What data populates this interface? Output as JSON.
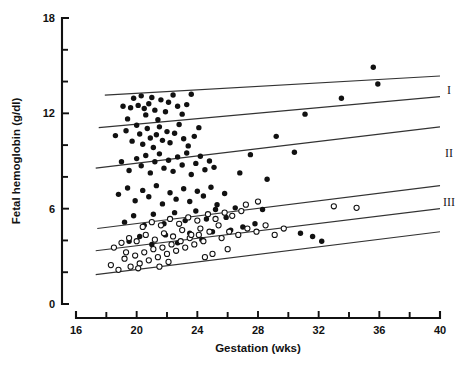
{
  "chart_data": {
    "type": "scatter",
    "title": "",
    "xlabel": "Gestation (wks)",
    "ylabel": "Fetal hemoglobin (g/dl)",
    "xlim": [
      16,
      40
    ],
    "ylim": [
      0,
      18
    ],
    "grid": false,
    "legend_position": "right-inline",
    "x_ticks_major": [
      16,
      20,
      24,
      28,
      32,
      36,
      40
    ],
    "x_tick_labels": [
      "16",
      "20",
      "24",
      "28",
      "32",
      "36",
      "40"
    ],
    "x_ticks_minor": [
      18,
      22,
      26,
      30,
      34,
      38
    ],
    "y_ticks_major": [
      0,
      6,
      12,
      18
    ],
    "y_tick_labels": [
      "0",
      "6",
      "12",
      "18"
    ],
    "y_ticks_minor": [
      2,
      4,
      8,
      10,
      14,
      16
    ],
    "annotations": [
      {
        "text": "I",
        "x": 40.6,
        "y": 13.45
      },
      {
        "text": "II",
        "x": 40.6,
        "y": 9.5
      },
      {
        "text": "III",
        "x": 40.6,
        "y": 6.45
      }
    ],
    "reference_lines": [
      {
        "name": "line-1-upper",
        "x0": 17.9,
        "y0": 13.15,
        "x1": 40.0,
        "y1": 14.35
      },
      {
        "name": "line-2",
        "x0": 17.5,
        "y0": 11.1,
        "x1": 40.0,
        "y1": 13.05
      },
      {
        "name": "line-3",
        "x0": 17.3,
        "y0": 8.55,
        "x1": 40.0,
        "y1": 11.15
      },
      {
        "name": "line-4",
        "x0": 17.4,
        "y0": 4.75,
        "x1": 40.0,
        "y1": 7.45
      },
      {
        "name": "line-5",
        "x0": 17.3,
        "y0": 3.35,
        "x1": 40.0,
        "y1": 6.0
      },
      {
        "name": "line-6-lower",
        "x0": 17.3,
        "y0": 1.85,
        "x1": 40.0,
        "y1": 4.55
      }
    ],
    "series": [
      {
        "name": "filled-circles",
        "marker": "filled-circle",
        "color": "#111111",
        "points": [
          [
            19.1,
            12.45
          ],
          [
            19.4,
            11.65
          ],
          [
            19.6,
            12.35
          ],
          [
            19.8,
            12.95
          ],
          [
            20.1,
            12.5
          ],
          [
            20.3,
            13.1
          ],
          [
            20.5,
            12.3
          ],
          [
            20.6,
            11.9
          ],
          [
            20.8,
            12.6
          ],
          [
            21.0,
            13.0
          ],
          [
            21.2,
            12.2
          ],
          [
            21.4,
            11.6
          ],
          [
            21.6,
            12.85
          ],
          [
            21.9,
            12.1
          ],
          [
            22.1,
            12.7
          ],
          [
            22.4,
            13.15
          ],
          [
            22.7,
            12.45
          ],
          [
            23.0,
            11.95
          ],
          [
            23.3,
            12.55
          ],
          [
            23.6,
            13.2
          ],
          [
            18.6,
            10.6
          ],
          [
            19.3,
            10.9
          ],
          [
            19.7,
            10.25
          ],
          [
            20.0,
            11.25
          ],
          [
            20.2,
            10.7
          ],
          [
            20.4,
            10.05
          ],
          [
            20.7,
            11.05
          ],
          [
            20.9,
            10.45
          ],
          [
            21.1,
            9.85
          ],
          [
            21.3,
            10.65
          ],
          [
            21.5,
            11.15
          ],
          [
            21.7,
            10.3
          ],
          [
            22.0,
            10.85
          ],
          [
            22.2,
            10.15
          ],
          [
            22.5,
            10.75
          ],
          [
            22.8,
            11.3
          ],
          [
            23.1,
            10.4
          ],
          [
            23.4,
            9.95
          ],
          [
            23.8,
            10.55
          ],
          [
            24.1,
            11.1
          ],
          [
            19.0,
            8.95
          ],
          [
            19.5,
            8.4
          ],
          [
            20.0,
            9.15
          ],
          [
            20.3,
            8.7
          ],
          [
            20.6,
            9.35
          ],
          [
            20.9,
            8.25
          ],
          [
            21.2,
            8.95
          ],
          [
            21.5,
            9.45
          ],
          [
            21.8,
            8.55
          ],
          [
            22.1,
            9.05
          ],
          [
            22.4,
            8.35
          ],
          [
            22.7,
            9.25
          ],
          [
            23.0,
            8.75
          ],
          [
            23.3,
            9.5
          ],
          [
            23.6,
            8.15
          ],
          [
            23.9,
            8.85
          ],
          [
            24.2,
            9.3
          ],
          [
            24.5,
            8.45
          ],
          [
            24.8,
            9.0
          ],
          [
            25.1,
            8.6
          ],
          [
            18.8,
            6.9
          ],
          [
            19.4,
            7.3
          ],
          [
            19.9,
            6.5
          ],
          [
            20.4,
            7.15
          ],
          [
            20.8,
            6.75
          ],
          [
            21.3,
            7.45
          ],
          [
            21.7,
            6.3
          ],
          [
            22.2,
            7.0
          ],
          [
            22.6,
            6.6
          ],
          [
            23.1,
            7.25
          ],
          [
            23.5,
            6.45
          ],
          [
            24.0,
            7.1
          ],
          [
            24.4,
            6.8
          ],
          [
            24.9,
            7.35
          ],
          [
            25.3,
            6.25
          ],
          [
            25.8,
            6.95
          ],
          [
            19.2,
            5.15
          ],
          [
            19.8,
            5.55
          ],
          [
            20.5,
            4.95
          ],
          [
            21.1,
            5.65
          ],
          [
            21.8,
            5.05
          ],
          [
            22.5,
            5.75
          ],
          [
            23.2,
            5.25
          ],
          [
            23.9,
            5.85
          ],
          [
            24.6,
            5.35
          ],
          [
            25.2,
            5.95
          ],
          [
            25.9,
            5.45
          ],
          [
            26.5,
            6.05
          ],
          [
            19.5,
            3.95
          ],
          [
            20.2,
            4.25
          ],
          [
            21.0,
            3.75
          ],
          [
            21.9,
            4.35
          ],
          [
            22.7,
            3.85
          ],
          [
            23.5,
            4.45
          ],
          [
            24.3,
            4.05
          ],
          [
            25.0,
            4.55
          ],
          [
            26.2,
            4.65
          ],
          [
            27.0,
            4.85
          ],
          [
            27.8,
            5.05
          ],
          [
            26.8,
            8.25
          ],
          [
            27.5,
            9.4
          ],
          [
            28.6,
            7.85
          ],
          [
            29.2,
            10.55
          ],
          [
            30.4,
            9.55
          ],
          [
            31.1,
            11.95
          ],
          [
            33.5,
            12.95
          ],
          [
            35.6,
            14.9
          ],
          [
            35.9,
            13.85
          ],
          [
            28.3,
            5.95
          ],
          [
            30.8,
            4.45
          ],
          [
            31.6,
            4.25
          ],
          [
            32.2,
            3.95
          ]
        ]
      },
      {
        "name": "open-circles",
        "marker": "open-circle",
        "color": "#ffffff",
        "points": [
          [
            18.3,
            2.45
          ],
          [
            18.8,
            2.15
          ],
          [
            19.2,
            2.85
          ],
          [
            19.6,
            2.35
          ],
          [
            19.9,
            3.05
          ],
          [
            20.2,
            2.55
          ],
          [
            20.5,
            3.25
          ],
          [
            20.8,
            2.75
          ],
          [
            21.1,
            3.45
          ],
          [
            21.4,
            2.95
          ],
          [
            21.7,
            3.55
          ],
          [
            22.0,
            3.15
          ],
          [
            22.3,
            3.75
          ],
          [
            22.6,
            3.35
          ],
          [
            22.9,
            3.95
          ],
          [
            23.2,
            3.55
          ],
          [
            23.5,
            4.15
          ],
          [
            23.8,
            3.75
          ],
          [
            24.1,
            4.35
          ],
          [
            24.4,
            3.95
          ],
          [
            19.0,
            3.85
          ],
          [
            19.5,
            4.15
          ],
          [
            20.0,
            3.95
          ],
          [
            20.6,
            4.35
          ],
          [
            21.2,
            4.05
          ],
          [
            21.8,
            4.45
          ],
          [
            22.4,
            4.25
          ],
          [
            23.0,
            4.65
          ],
          [
            23.6,
            4.35
          ],
          [
            24.2,
            4.75
          ],
          [
            24.8,
            4.55
          ],
          [
            25.4,
            4.95
          ],
          [
            20.4,
            4.85
          ],
          [
            21.0,
            5.15
          ],
          [
            21.6,
            4.95
          ],
          [
            22.2,
            5.35
          ],
          [
            22.8,
            5.05
          ],
          [
            23.4,
            5.45
          ],
          [
            24.0,
            5.25
          ],
          [
            24.7,
            5.65
          ],
          [
            25.2,
            5.35
          ],
          [
            25.8,
            5.75
          ],
          [
            26.3,
            5.55
          ],
          [
            26.9,
            5.85
          ],
          [
            25.6,
            4.15
          ],
          [
            26.1,
            4.55
          ],
          [
            26.7,
            4.35
          ],
          [
            27.3,
            4.75
          ],
          [
            27.9,
            4.55
          ],
          [
            28.5,
            4.95
          ],
          [
            29.1,
            4.35
          ],
          [
            29.7,
            4.75
          ],
          [
            27.2,
            6.25
          ],
          [
            28.0,
            6.45
          ],
          [
            33.0,
            6.15
          ],
          [
            34.5,
            6.05
          ],
          [
            18.5,
            3.55
          ],
          [
            19.3,
            3.25
          ],
          [
            20.1,
            2.25
          ],
          [
            21.5,
            2.35
          ],
          [
            22.1,
            2.65
          ],
          [
            24.5,
            2.95
          ],
          [
            25.0,
            3.15
          ],
          [
            26.0,
            3.45
          ]
        ]
      }
    ]
  }
}
